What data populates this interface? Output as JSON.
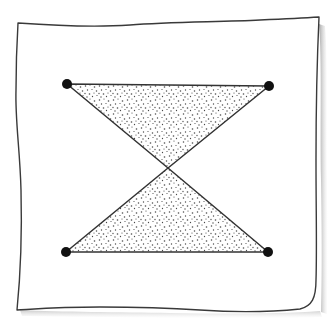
{
  "diagram": {
    "type": "hand-drawn geometric illustration",
    "colors": {
      "background": "#ffffff",
      "paper": "#ffffff",
      "outline": "#3a3a3a",
      "shadow": "#b8b8b8",
      "stipple": "#4a4a4a",
      "vertex": "#111111"
    },
    "frame": {
      "corners": {
        "top_left": [
          18,
          23
        ],
        "top_right": [
          319,
          17
        ],
        "bottom_right": [
          317,
          309
        ],
        "bottom_left": [
          17,
          310
        ]
      }
    },
    "vertices": [
      {
        "id": "top-left",
        "x": 67,
        "y": 84
      },
      {
        "id": "top-right",
        "x": 269,
        "y": 86
      },
      {
        "id": "bottom-left",
        "x": 66,
        "y": 252
      },
      {
        "id": "bottom-right",
        "x": 268,
        "y": 252
      }
    ],
    "crossing_point": {
      "x": 168,
      "y": 168
    },
    "triangles": [
      {
        "id": "top-triangle",
        "points": [
          [
            67,
            84
          ],
          [
            269,
            86
          ],
          [
            168,
            168
          ]
        ],
        "fill": "stippled"
      },
      {
        "id": "bottom-triangle",
        "points": [
          [
            66,
            252
          ],
          [
            268,
            252
          ],
          [
            168,
            168
          ]
        ],
        "fill": "stippled"
      }
    ],
    "vertex_radius": 5
  }
}
